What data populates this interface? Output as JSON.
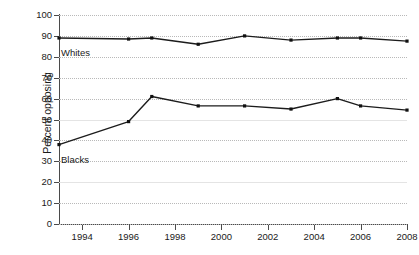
{
  "chart_data": {
    "type": "line",
    "title": "",
    "subtitle": "",
    "xlabel": "",
    "ylabel": "Percent opposing",
    "xlim": [
      1993,
      2008
    ],
    "ylim": [
      0,
      100
    ],
    "grid": true,
    "grid_axis": "y",
    "legend_position": "inline-labels",
    "y_ticks": [
      0,
      10,
      20,
      30,
      40,
      50,
      60,
      70,
      80,
      90,
      100
    ],
    "y_tick_labels": [
      "0",
      "10",
      "20",
      "30",
      "40",
      "50",
      "60",
      "70",
      "80",
      "90",
      "100"
    ],
    "x_ticks": [
      1994,
      1996,
      1998,
      2000,
      2002,
      2004,
      2006,
      2008
    ],
    "x_tick_labels": [
      "1994",
      "1996",
      "1998",
      "2000",
      "2002",
      "2004",
      "2006",
      "2008"
    ],
    "x": [
      1993,
      1996,
      1997,
      1999,
      2001,
      2003,
      2005,
      2006,
      2008
    ],
    "series": [
      {
        "name": "Whites",
        "label": "Whites",
        "color": "#1c1c1c",
        "marker": "square",
        "values": [
          89,
          88.5,
          89,
          86,
          90,
          88,
          89,
          89,
          87.5
        ]
      },
      {
        "name": "Blacks",
        "label": "Blacks",
        "color": "#1c1c1c",
        "marker": "square",
        "values": [
          38,
          49,
          61,
          56.5,
          56.5,
          55,
          60,
          56.5,
          54.5
        ]
      }
    ],
    "annotations": [
      {
        "text": "Whites",
        "series": "Whites",
        "x": 1993,
        "y": 89
      },
      {
        "text": "Blacks",
        "series": "Blacks",
        "x": 1993,
        "y": 38
      }
    ]
  },
  "colors": {
    "background": "#ffffff",
    "line": "#1c1c1c",
    "marker": "#101010",
    "axis": "#4a4a4a",
    "gridline": "#b9b9b9",
    "text": "#1a1a1a"
  }
}
